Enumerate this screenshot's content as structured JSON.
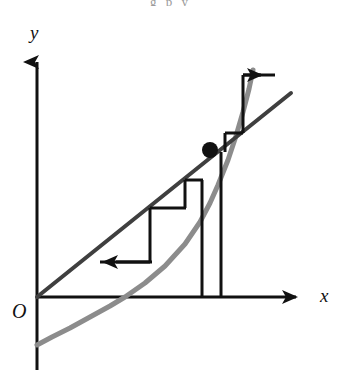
{
  "figure": {
    "caption_fragment": "g p y",
    "background_color": "#ffffff",
    "width": 341,
    "height": 375
  },
  "axes": {
    "x_label": "x",
    "y_label": "y",
    "origin_label": "O",
    "color": "#111111",
    "stroke_width": 3,
    "x_axis": {
      "y": 297,
      "x_start": 37,
      "x_end": 310,
      "arrow": "right"
    },
    "y_axis": {
      "x": 37,
      "y_start": 370,
      "y_end": 50,
      "arrow": "up"
    }
  },
  "curves": [
    {
      "name": "identity-line",
      "description": "straight line y = x through the origin",
      "color": "#3f3f3f",
      "stroke_width": 4,
      "points": [
        [
          37,
          297
        ],
        [
          291,
          93
        ]
      ]
    },
    {
      "name": "function-curve",
      "description": "upward-opening parabola g(x) crossing the line at the fixed point",
      "color": "#8c8c8c",
      "stroke_width": 5,
      "points": [
        [
          37,
          345
        ],
        [
          52,
          337
        ],
        [
          70,
          328
        ],
        [
          90,
          317
        ],
        [
          110,
          306
        ],
        [
          125,
          297
        ],
        [
          145,
          283
        ],
        [
          165,
          266
        ],
        [
          185,
          244
        ],
        [
          200,
          222
        ],
        [
          210,
          203
        ],
        [
          218,
          185
        ],
        [
          228,
          160
        ],
        [
          236,
          136
        ],
        [
          243,
          112
        ],
        [
          249,
          89
        ],
        [
          253,
          70
        ]
      ]
    }
  ],
  "fixed_point": {
    "name": "fixed-point",
    "x": 210,
    "y": 150,
    "radius": 8,
    "color": "#111111"
  },
  "cobweb": {
    "color": "#111111",
    "stroke_width": 3,
    "segments": [
      {
        "name": "step-h1",
        "type": "horizontal",
        "x1": 100,
        "y1": 262,
        "x2": 152,
        "y2": 262
      },
      {
        "name": "step-v1",
        "type": "vertical",
        "x1": 150,
        "y1": 262,
        "x2": 150,
        "y2": 208
      },
      {
        "name": "step-h2",
        "type": "horizontal",
        "x1": 150,
        "y1": 208,
        "x2": 186,
        "y2": 208
      },
      {
        "name": "step-v2",
        "type": "vertical",
        "x1": 185,
        "y1": 208,
        "x2": 185,
        "y2": 180
      },
      {
        "name": "step-h3",
        "type": "horizontal",
        "x1": 185,
        "y1": 180,
        "x2": 203,
        "y2": 180
      },
      {
        "name": "drop-v1",
        "type": "vertical",
        "x1": 202,
        "y1": 180,
        "x2": 202,
        "y2": 297
      },
      {
        "name": "drop-v2",
        "type": "vertical",
        "x1": 221,
        "y1": 152,
        "x2": 221,
        "y2": 297
      },
      {
        "name": "step-v3",
        "type": "vertical",
        "x1": 225,
        "y1": 152,
        "x2": 225,
        "y2": 133
      },
      {
        "name": "step-h4",
        "type": "horizontal",
        "x1": 225,
        "y1": 133,
        "x2": 243,
        "y2": 133
      },
      {
        "name": "step-v4",
        "type": "vertical",
        "x1": 243,
        "y1": 133,
        "x2": 243,
        "y2": 75
      },
      {
        "name": "step-h5",
        "type": "horizontal",
        "x1": 243,
        "y1": 75,
        "x2": 275,
        "y2": 75
      }
    ],
    "arrows": [
      {
        "name": "arrow-left",
        "direction": "left",
        "tip_x": 102,
        "tip_y": 262,
        "size": 13
      },
      {
        "name": "arrow-right",
        "direction": "right",
        "tip_x": 275,
        "tip_y": 75,
        "size": 13
      }
    ]
  }
}
